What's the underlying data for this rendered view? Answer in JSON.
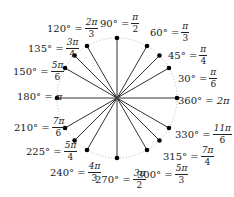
{
  "diagram": {
    "center": [
      117,
      98
    ],
    "radius": 60,
    "colors": {
      "line": "#333333",
      "dot": "#000000",
      "circle": "#aaaaaa"
    },
    "angles": [
      {
        "deg": 0,
        "label": "360° =",
        "num": "2π",
        "den": "",
        "x": 178,
        "y": 96
      },
      {
        "deg": 30,
        "label": "30° =",
        "num": "π",
        "den": "6",
        "x": 178,
        "y": 68
      },
      {
        "deg": 45,
        "label": "45° =",
        "num": "π",
        "den": "4",
        "x": 168,
        "y": 45
      },
      {
        "deg": 60,
        "label": "60° =",
        "num": "π",
        "den": "3",
        "x": 150,
        "y": 22
      },
      {
        "deg": 90,
        "label": "90° =",
        "num": "π",
        "den": "2",
        "x": 100,
        "y": 13
      },
      {
        "deg": 120,
        "label": "120° =",
        "num": "2π",
        "den": "3",
        "x": 47,
        "y": 18
      },
      {
        "deg": 135,
        "label": "135° =",
        "num": "3π",
        "den": "4",
        "x": 28,
        "y": 38
      },
      {
        "deg": 150,
        "label": "150° =",
        "num": "5π",
        "den": "6",
        "x": 13,
        "y": 61
      },
      {
        "deg": 180,
        "label": "180° =",
        "num": "π",
        "den": "",
        "x": 17,
        "y": 92
      },
      {
        "deg": 210,
        "label": "210° =",
        "num": "7π",
        "den": "6",
        "x": 14,
        "y": 117
      },
      {
        "deg": 225,
        "label": "225° =",
        "num": "5π",
        "den": "4",
        "x": 26,
        "y": 141
      },
      {
        "deg": 240,
        "label": "240° =",
        "num": "4π",
        "den": "3",
        "x": 50,
        "y": 162
      },
      {
        "deg": 270,
        "label": "270° =",
        "num": "3π",
        "den": "2",
        "x": 95,
        "y": 169
      },
      {
        "deg": 300,
        "label": "300° =",
        "num": "5π",
        "den": "3",
        "x": 137,
        "y": 164
      },
      {
        "deg": 315,
        "label": "315° =",
        "num": "7π",
        "den": "4",
        "x": 163,
        "y": 146
      },
      {
        "deg": 330,
        "label": "330° =",
        "num": "11π",
        "den": "6",
        "x": 175,
        "y": 124
      }
    ]
  }
}
